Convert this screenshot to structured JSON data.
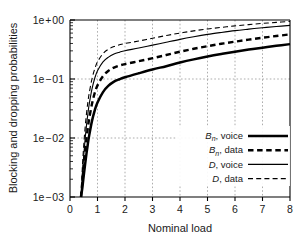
{
  "chart_data": {
    "type": "line",
    "title": "",
    "xlabel": "Nominal load",
    "ylabel": "Blocking and dropping probabilities",
    "xlim": [
      0,
      8
    ],
    "ylim": [
      0.001,
      1
    ],
    "yscale": "log",
    "xscale": "linear",
    "grid": true,
    "legend_position": "lower-right",
    "xticks": [
      "0",
      "1",
      "2",
      "3",
      "4",
      "5",
      "6",
      "7",
      "8"
    ],
    "xtick_values": [
      0,
      1,
      2,
      3,
      4,
      5,
      6,
      7,
      8
    ],
    "yticks": [
      "1e + 00",
      "1e − 01",
      "1e − 02",
      "1e − 03"
    ],
    "ytick_values": [
      1,
      0.1,
      0.01,
      0.001
    ],
    "x": [
      0.4,
      0.45,
      0.5,
      0.55,
      0.6,
      0.65,
      0.7,
      0.8,
      0.9,
      1.0,
      1.2,
      1.4,
      1.6,
      1.8,
      2.0,
      2.5,
      3.0,
      3.5,
      4.0,
      4.5,
      5.0,
      5.5,
      6.0,
      6.5,
      7.0,
      7.5,
      8.0
    ],
    "series": [
      {
        "name": "Bn, voice",
        "label_main": "B",
        "label_sub": "n",
        "label_tail": ", voice",
        "style": "solid",
        "width": "thick",
        "color": "#000000",
        "values": [
          0.001,
          0.00145,
          0.0023,
          0.0036,
          0.0055,
          0.008,
          0.0112,
          0.0195,
          0.0295,
          0.04,
          0.06,
          0.077,
          0.09,
          0.099,
          0.107,
          0.125,
          0.145,
          0.165,
          0.19,
          0.215,
          0.24,
          0.265,
          0.29,
          0.315,
          0.34,
          0.365,
          0.39
        ]
      },
      {
        "name": "Bn, data",
        "label_main": "B",
        "label_sub": "n",
        "label_tail": ", data",
        "style": "dashed",
        "width": "thick",
        "color": "#000000",
        "values": [
          0.001,
          0.00185,
          0.0034,
          0.006,
          0.0098,
          0.015,
          0.0215,
          0.038,
          0.058,
          0.078,
          0.112,
          0.138,
          0.156,
          0.169,
          0.179,
          0.2,
          0.225,
          0.255,
          0.29,
          0.325,
          0.36,
          0.395,
          0.43,
          0.465,
          0.5,
          0.535,
          0.57
        ]
      },
      {
        "name": "D, voice",
        "label_main": "D",
        "label_sub": "",
        "label_tail": ", voice",
        "style": "solid",
        "width": "thin",
        "color": "#000000",
        "values": [
          0.001,
          0.0024,
          0.0051,
          0.0096,
          0.0164,
          0.0258,
          0.0378,
          0.068,
          0.103,
          0.138,
          0.195,
          0.235,
          0.265,
          0.285,
          0.302,
          0.335,
          0.375,
          0.42,
          0.47,
          0.52,
          0.57,
          0.615,
          0.66,
          0.7,
          0.74,
          0.775,
          0.81
        ]
      },
      {
        "name": "D, data",
        "label_main": "D",
        "label_sub": "",
        "label_tail": ", data",
        "style": "dashed",
        "width": "thin",
        "color": "#000000",
        "values": [
          0.001,
          0.0032,
          0.0076,
          0.015,
          0.026,
          0.0405,
          0.058,
          0.101,
          0.148,
          0.195,
          0.27,
          0.32,
          0.355,
          0.38,
          0.4,
          0.44,
          0.49,
          0.545,
          0.6,
          0.655,
          0.705,
          0.75,
          0.795,
          0.835,
          0.875,
          0.91,
          0.945
        ]
      }
    ]
  },
  "legend": {
    "items": [
      {
        "main": "B",
        "sub": "n",
        "tail": ", voice"
      },
      {
        "main": "B",
        "sub": "n",
        "tail": ", data"
      },
      {
        "main": "D",
        "sub": "",
        "tail": ", voice"
      },
      {
        "main": "D",
        "sub": "",
        "tail": ", data"
      }
    ]
  }
}
